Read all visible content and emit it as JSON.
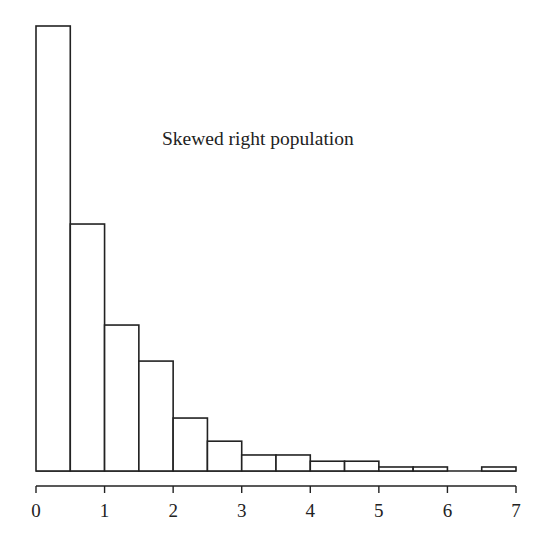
{
  "chart_data": {
    "type": "bar",
    "title": "Skewed right population",
    "xlabel": "",
    "ylabel": "",
    "bin_edges": [
      0,
      0.5,
      1,
      1.5,
      2,
      2.5,
      3,
      3.5,
      4,
      4.5,
      5,
      5.5,
      6,
      6.5,
      7
    ],
    "categories": [
      "0-0.5",
      "0.5-1",
      "1-1.5",
      "1.5-2",
      "2-2.5",
      "2.5-3",
      "3-3.5",
      "3.5-4",
      "4-4.5",
      "4.5-5",
      "5-5.5",
      "5.5-6",
      "6-6.5",
      "6.5-7"
    ],
    "values": [
      100,
      55.5,
      32.8,
      24.7,
      11.9,
      6.7,
      3.6,
      3.6,
      2.2,
      2.2,
      0.9,
      0.9,
      0,
      0.9
    ],
    "value_units": "relative frequency (tallest bar = 100)",
    "xlim": [
      0,
      7
    ],
    "xticks": [
      "0",
      "1",
      "2",
      "3",
      "4",
      "5",
      "6",
      "7"
    ],
    "y_axis_shown": false,
    "grid": false,
    "legend": null
  },
  "colors": {
    "bar_fill": "#ffffff",
    "bar_stroke": "#222222",
    "axis": "#222222",
    "text": "#222222"
  }
}
